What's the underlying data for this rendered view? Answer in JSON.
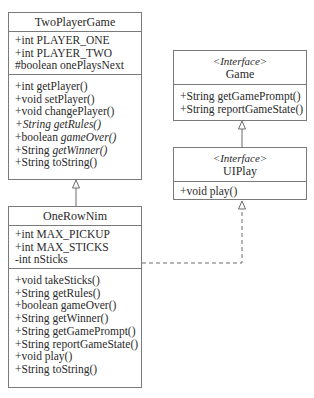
{
  "classes": {
    "two_player_game": {
      "name": "TwoPlayerGame",
      "attributes": [
        {
          "text": "+int PLAYER_ONE"
        },
        {
          "text": "+int PLAYER_TWO"
        },
        {
          "text": "#boolean onePlaysNext"
        }
      ],
      "methods": [
        {
          "prefix": "+int getPlayer()",
          "italic": ""
        },
        {
          "prefix": "+void setPlayer()",
          "italic": ""
        },
        {
          "prefix": "+void changePlayer()",
          "italic": ""
        },
        {
          "prefix": "+",
          "italic": "String getRules()"
        },
        {
          "prefix": "+boolean ",
          "italic": "gameOver()"
        },
        {
          "prefix": "+String ",
          "italic": "getWinner()"
        },
        {
          "prefix": "+String toString()",
          "italic": ""
        }
      ]
    },
    "one_row_nim": {
      "name": "OneRowNim",
      "attributes": [
        {
          "text": "+int MAX_PICKUP"
        },
        {
          "text": "+int MAX_STICKS"
        },
        {
          "text": "-int nSticks"
        }
      ],
      "methods": [
        {
          "text": "+void takeSticks()"
        },
        {
          "text": "+String getRules()"
        },
        {
          "text": "+boolean gameOver()"
        },
        {
          "text": "+String getWinner()"
        },
        {
          "text": "+String getGamePrompt()"
        },
        {
          "text": "+String reportGameState()"
        },
        {
          "text": "+void play()"
        },
        {
          "text": "+String toString()"
        }
      ]
    },
    "game": {
      "stereotype": "<Interface>",
      "name": "Game",
      "methods": [
        {
          "text": "+String getGamePrompt()"
        },
        {
          "text": "+String reportGameState()"
        }
      ]
    },
    "ui_play": {
      "stereotype": "<Interface>",
      "name": "UIPlay",
      "methods": [
        {
          "text": "+void play()"
        }
      ]
    }
  },
  "relationships": [
    {
      "from": "OneRowNim",
      "to": "TwoPlayerGame",
      "type": "inheritance"
    },
    {
      "from": "UIPlay",
      "to": "Game",
      "type": "inheritance"
    },
    {
      "from": "OneRowNim",
      "to": "UIPlay",
      "type": "realization"
    }
  ]
}
